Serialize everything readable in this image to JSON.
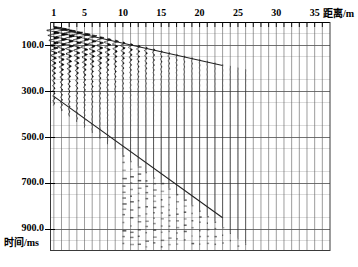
{
  "figure": {
    "kind": "seismic-wiggle-record",
    "background_color": "#ffffff",
    "ink_color": "#000000",
    "grid_color": "#555555",
    "minor_grid_color": "#bbbbbb"
  },
  "axes": {
    "x": {
      "title": "距离/m",
      "unit": "m",
      "min": 0.5,
      "max": 37.0,
      "tick_interval": 1,
      "labeled_ticks": [
        {
          "value": 1,
          "label": "1"
        },
        {
          "value": 5,
          "label": "5"
        },
        {
          "value": 10,
          "label": "10"
        },
        {
          "value": 15,
          "label": "15"
        },
        {
          "value": 20,
          "label": "20"
        },
        {
          "value": 25,
          "label": "25"
        },
        {
          "value": 30,
          "label": "30"
        },
        {
          "value": 35,
          "label": "35"
        }
      ],
      "position": "top"
    },
    "y": {
      "title": "时间/ms",
      "unit": "ms",
      "min": 0,
      "max": 1000,
      "direction": "downward",
      "major_interval": 200,
      "minor_interval": 50,
      "labeled_ticks": [
        {
          "value": 100,
          "label": "100.0"
        },
        {
          "value": 300,
          "label": "300.0"
        },
        {
          "value": 500,
          "label": "500.0"
        },
        {
          "value": 700,
          "label": "700.0"
        },
        {
          "value": 900,
          "label": "900.0"
        }
      ],
      "position": "left"
    }
  },
  "chart_data": {
    "type": "line",
    "title": "",
    "xlabel": "距离/m",
    "ylabel": "时间/ms",
    "xlim": [
      0.5,
      37.0
    ],
    "ylim": [
      0,
      1000
    ],
    "grid": true,
    "legend": "none",
    "traces": {
      "count": 36,
      "first_offset_m": 1,
      "spacing_m": 1,
      "display": "variable-area wiggle",
      "fill": "positive-lobe black",
      "amplitude_decay": "strong with offset",
      "dominant_period_ms": 22,
      "energetic_window_ms": [
        20,
        330
      ],
      "note": "Highest amplitude black lobes concentrated between 1 m and 12 m offset, from about 20 ms to 330 ms; amplitudes fade to faint dots beyond about 22 m."
    },
    "series": [
      {
        "name": "first-arrival-branch-1",
        "role": "direct / shallow refractor travel-time line",
        "x": [
          1,
          23
        ],
        "values": [
          25,
          190
        ]
      },
      {
        "name": "first-arrival-branch-2",
        "role": "deep refractor travel-time line",
        "x": [
          1,
          23
        ],
        "values": [
          325,
          855
        ]
      }
    ]
  }
}
